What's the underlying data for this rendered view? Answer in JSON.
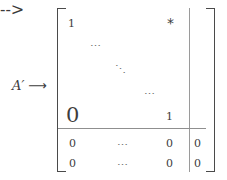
{
  "figure": {
    "label": {
      "symbol": "A′",
      "arrow": "⟶"
    },
    "brackets": {
      "left": "[",
      "right": "]"
    },
    "entries": {
      "top_left_one": "1",
      "top_right_star": "*",
      "dots_row_upper": "⋯",
      "dots_diagonal": "⋱",
      "dots_row_lower": "⋯",
      "bottom_left_zero": "0",
      "diagonal_last_one": "1",
      "row6_left_zero": "0",
      "row6_dots": "⋯",
      "row6_right_zero": "0",
      "row6_aug_zero": "0",
      "row7_left_zero": "0",
      "row7_dots": "⋯",
      "row7_right_zero": "0",
      "row7_aug_zero": "0"
    },
    "colors": {
      "ink": "#3d3d3d",
      "rule": "#8f8f8f",
      "bracket": "#4a4a4a",
      "background": "#ffffff"
    }
  }
}
